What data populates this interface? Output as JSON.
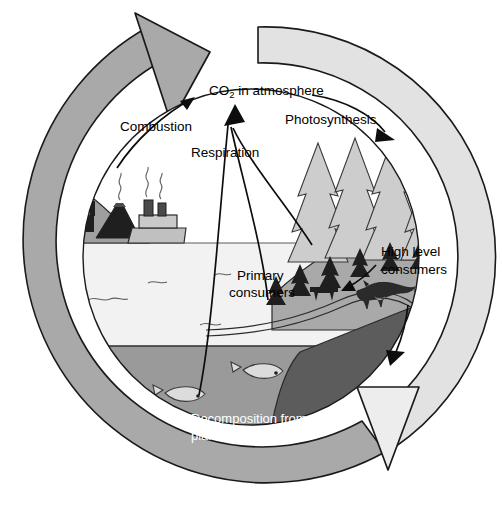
{
  "figure": {
    "type": "diagram",
    "background": "#ffffff"
  },
  "colors": {
    "ring_dark": "#a9a9a9",
    "ring_light": "#e2e2e2",
    "outline": "#1a1a1a",
    "sky": "#ffffff",
    "water": "#f2f2f2",
    "seabed": "#9a9a9a",
    "deep_sediment": "#5c5c5c",
    "land": "#a9a9a9",
    "tree": "#cfcfcf",
    "dark_silhouette": "#262626",
    "ship": "#c2c2c2",
    "label_text": "#000000",
    "label_text_inverse": "#ffffff"
  },
  "ring": {
    "name": "cycle-ring",
    "segments": [
      {
        "id": "ring-dark-segment",
        "shade": "#a9a9a9",
        "side": "left",
        "arrow": "top-left-up"
      },
      {
        "id": "ring-light-segment",
        "shade": "#e2e2e2",
        "side": "right",
        "arrow": "bottom-right-down"
      }
    ],
    "arrows": [
      {
        "name": "ring-arrow-top",
        "direction": "up-right",
        "fill": "#a9a9a9"
      },
      {
        "name": "ring-arrow-bottom",
        "direction": "down",
        "fill": "#eaeaea"
      }
    ]
  },
  "labels": {
    "co2": {
      "text_before": "CO",
      "subscript": "2",
      "text_after": " in atmosphere"
    },
    "combustion": "Combustion",
    "respiration": "Respiration",
    "photosynthesis": "Photosynthesis",
    "primary_consumers_line1": "Primary",
    "primary_consumers_line2": "consumers",
    "high_level_consumers_line1": "High level",
    "high_level_consumers_line2": "consumers",
    "decomposition_line1": "Decomposition from dead",
    "decomposition_line2": "plants and animals"
  },
  "processes": [
    {
      "name": "combustion",
      "label": "Combustion",
      "from": "factories-and-ship",
      "to": "co2-in-atmosphere",
      "arrow": "curved-up-right"
    },
    {
      "name": "respiration",
      "label": "Respiration",
      "from": "ocean-land-organisms",
      "to": "co2-in-atmosphere",
      "arrow": "three-curves-converging-up"
    },
    {
      "name": "photosynthesis",
      "label": "Photosynthesis",
      "from": "co2-in-atmosphere",
      "to": "forest",
      "arrow": "curved-down-right"
    },
    {
      "name": "consumption",
      "label": "Primary consumers to high level consumers",
      "from": "primary-consumers",
      "to": "high-level-consumers",
      "arrow": "short-down-left"
    },
    {
      "name": "decomposition",
      "label": "Decomposition from dead plants and animals",
      "from": "high-level-consumers",
      "to": "sediment",
      "arrow": "down-into-sediment"
    }
  ],
  "scene": {
    "emitters": [
      {
        "name": "factory",
        "smoke": true
      },
      {
        "name": "volcano",
        "smoke": true
      },
      {
        "name": "ship",
        "smoke": true
      }
    ],
    "forest": {
      "name": "conifer-forest",
      "large_trees": 4,
      "small_trees": 6
    },
    "animals": [
      {
        "name": "deer-silhouette",
        "role": "primary consumer"
      },
      {
        "name": "fox",
        "role": "high level consumer"
      },
      {
        "name": "fish",
        "role": "aquatic organism",
        "count": 2
      }
    ],
    "layers": [
      "sky",
      "water-surface",
      "ocean",
      "seabed",
      "deep-sediment"
    ]
  }
}
